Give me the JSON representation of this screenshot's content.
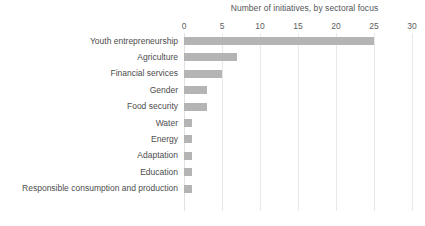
{
  "chart_data": {
    "type": "bar",
    "orientation": "horizontal",
    "title": "Number of initiatives, by sectoral focus",
    "xlabel": "",
    "ylabel": "",
    "xlim": [
      0,
      30
    ],
    "xticks": [
      0,
      5,
      10,
      15,
      20,
      25,
      30
    ],
    "xtick_labels": [
      "0",
      "5",
      "10",
      "15",
      "20",
      "25",
      "30"
    ],
    "grid": true,
    "legend": null,
    "bar_color": "#b4b4b4",
    "categories": [
      "Youth entrepreneurship",
      "Agriculture",
      "Financial services",
      "Gender",
      "Food security",
      "Water",
      "Energy",
      "Adaptation",
      "Education",
      "Responsible consumption and production"
    ],
    "values": [
      25,
      7,
      5,
      3,
      3,
      1,
      1,
      1,
      1,
      1
    ]
  },
  "footnote": {
    "text": ""
  }
}
